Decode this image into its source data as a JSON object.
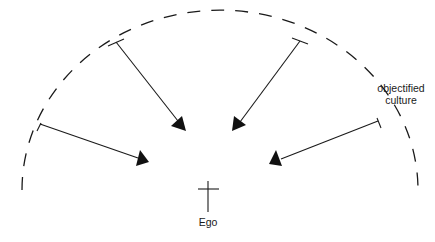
{
  "diagram": {
    "labels": {
      "culture_line1": "objectified",
      "culture_line2": "culture",
      "ego": "Ego"
    },
    "elements": {
      "boundary": "dashed semicircular arc representing objectified culture",
      "center": "cross symbol representing the Ego",
      "arrows": [
        {
          "name": "arrow-upper-left",
          "from": [
            116,
            42
          ],
          "to": [
            186,
            131
          ]
        },
        {
          "name": "arrow-upper-right",
          "from": [
            300,
            41
          ],
          "to": [
            232,
            131
          ]
        },
        {
          "name": "arrow-lower-left",
          "from": [
            40,
            124
          ],
          "to": [
            149,
            162
          ]
        },
        {
          "name": "arrow-lower-right",
          "from": [
            378,
            121
          ],
          "to": [
            269,
            164
          ]
        }
      ]
    },
    "colors": {
      "stroke": "#1a1a1a",
      "background": "#ffffff"
    }
  }
}
